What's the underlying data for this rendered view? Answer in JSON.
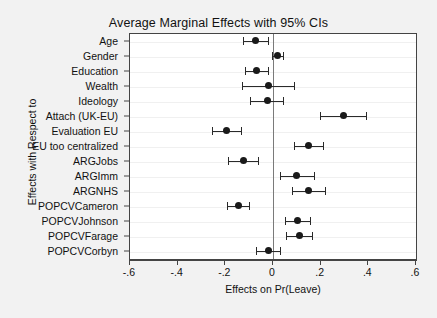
{
  "chart_data": {
    "type": "scatter",
    "title": "Average Marginal Effects with 95% CIs",
    "xlabel": "Effects on Pr(Leave)",
    "ylabel": "Effects with Respect to",
    "xlim": [
      -0.6,
      0.6
    ],
    "xticks": [
      -0.6,
      -0.4,
      -0.2,
      0,
      0.2,
      0.4,
      0.6
    ],
    "xticklabels": [
      "-.6",
      "-.4",
      "-.2",
      "0",
      ".2",
      ".4",
      ".6"
    ],
    "grid": "horizontal-faint",
    "legend": "none",
    "zero_reference_line": 0,
    "orientation": "horizontal",
    "categories": [
      "Age",
      "Gender",
      "Education",
      "Wealth",
      "Ideology",
      "Attach (UK-EU)",
      "Evaluation EU",
      "EU too centralized",
      "ARGJobs",
      "ARGImm",
      "ARGNHS",
      "POPCVCameron",
      "POPCVJohnson",
      "POPCVFarage",
      "POPCVCorbyn"
    ],
    "points": [
      {
        "label": "Age",
        "estimate": -0.072,
        "ci_low": -0.125,
        "ci_high": -0.022
      },
      {
        "label": "Gender",
        "estimate": 0.018,
        "ci_low": -0.005,
        "ci_high": 0.042
      },
      {
        "label": "Education",
        "estimate": -0.07,
        "ci_low": -0.118,
        "ci_high": -0.022
      },
      {
        "label": "Wealth",
        "estimate": -0.02,
        "ci_low": -0.13,
        "ci_high": 0.09
      },
      {
        "label": "Ideology",
        "estimate": -0.025,
        "ci_low": -0.095,
        "ci_high": 0.04
      },
      {
        "label": "Attach (UK-EU)",
        "estimate": 0.295,
        "ci_low": 0.196,
        "ci_high": 0.39
      },
      {
        "label": "Evaluation EU",
        "estimate": -0.196,
        "ci_low": -0.258,
        "ci_high": -0.136
      },
      {
        "label": "EU too centralized",
        "estimate": 0.148,
        "ci_low": 0.088,
        "ci_high": 0.21
      },
      {
        "label": "ARGJobs",
        "estimate": -0.122,
        "ci_low": -0.188,
        "ci_high": -0.062
      },
      {
        "label": "ARGImm",
        "estimate": 0.1,
        "ci_low": 0.03,
        "ci_high": 0.17
      },
      {
        "label": "ARGNHS",
        "estimate": 0.148,
        "ci_low": 0.078,
        "ci_high": 0.218
      },
      {
        "label": "POPCVCameron",
        "estimate": -0.146,
        "ci_low": -0.192,
        "ci_high": -0.1
      },
      {
        "label": "POPCVJohnson",
        "estimate": 0.102,
        "ci_low": 0.05,
        "ci_high": 0.155
      },
      {
        "label": "POPCVFarage",
        "estimate": 0.11,
        "ci_low": 0.055,
        "ci_high": 0.165
      },
      {
        "label": "POPCVCorbyn",
        "estimate": -0.02,
        "ci_low": -0.072,
        "ci_high": 0.03
      }
    ],
    "colors": {
      "marker": "#1a1a1a",
      "ci_line": "#2a2a2a",
      "zero_line": "#7a7a7a",
      "plot_background": "#ffffff",
      "figure_background": "#f2f2f2",
      "axis": "#444444",
      "text": "#111111"
    }
  }
}
